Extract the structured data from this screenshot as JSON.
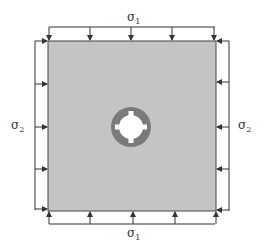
{
  "diagram": {
    "type": "biaxial-loaded plate with central hole",
    "labels": {
      "top": {
        "symbol": "σ",
        "subscript": "1"
      },
      "bottom": {
        "symbol": "σ",
        "subscript": "1"
      },
      "left": {
        "symbol": "σ",
        "subscript": "2"
      },
      "right": {
        "symbol": "σ",
        "subscript": "2"
      }
    },
    "colors": {
      "plate": "#c4c4c4",
      "ring": "#7a7a7a",
      "hole": "#ffffff",
      "lines": "#333333"
    },
    "arrows_per_side": 5
  }
}
